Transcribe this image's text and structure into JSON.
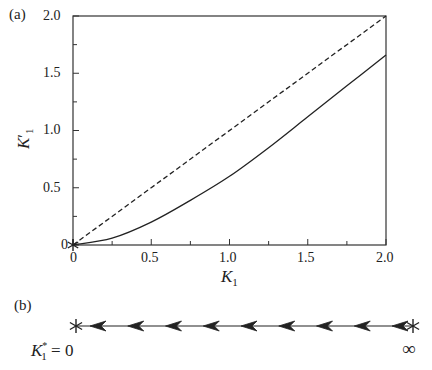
{
  "panel_a_label": "(a)",
  "panel_b_label": "(b)",
  "chart_data": [
    {
      "type": "line",
      "title": "",
      "xlabel": "K1",
      "ylabel": "K1'",
      "xlim": [
        0,
        2.0
      ],
      "ylim": [
        0,
        2.0
      ],
      "grid": false,
      "xticks": [
        "0",
        "0.5",
        "1.0",
        "1.5",
        "2.0"
      ],
      "yticks": [
        "0",
        "0.5",
        "1.0",
        "1.5",
        "2.0"
      ],
      "series": [
        {
          "name": "recursion K1' vs K1",
          "style": "solid",
          "x": [
            0,
            0.25,
            0.5,
            0.75,
            1.0,
            1.25,
            1.5,
            1.75,
            2.0
          ],
          "y": [
            0,
            0.06,
            0.2,
            0.39,
            0.6,
            0.85,
            1.12,
            1.39,
            1.66
          ]
        },
        {
          "name": "K1' = K1",
          "style": "dashed",
          "x": [
            0,
            2.0
          ],
          "y": [
            0,
            2.0
          ]
        }
      ],
      "annotations": [
        "fixed point marker * at (0,0)"
      ]
    },
    {
      "type": "flow",
      "description": "RG flow diagram",
      "fixed_points": [
        {
          "label": "K1* = 0",
          "kind": "stable"
        },
        {
          "label": "∞",
          "kind": "unstable"
        }
      ],
      "arrow_direction": "left",
      "arrow_count": 9
    }
  ],
  "axis": {
    "xlabel_main": "K",
    "xlabel_sub": "1",
    "ylabel_main": "K",
    "ylabel_sub": "1",
    "ylabel_prime": "′"
  },
  "flow": {
    "left_label_main": "K",
    "left_label_sub": "1",
    "left_label_sup": "*",
    "left_label_rest": " = 0",
    "right_label": "∞"
  }
}
